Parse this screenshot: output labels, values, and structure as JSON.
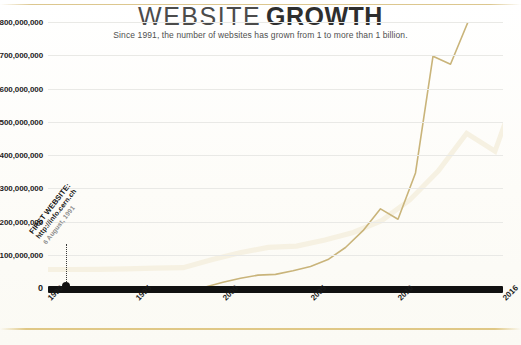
{
  "header": {
    "title_light": "WEBSITE",
    "title_bold": "GROWTH",
    "subtitle": "Since 1991, the number of websites has grown from 1 to more than 1 billion."
  },
  "annotation": {
    "line1": "FIRST WEBSITE:",
    "line2": "http://info.cern.ch",
    "line3": "6 August, 1991",
    "marker_year": 1991
  },
  "colors": {
    "line": "#c9b47a",
    "line_dark": "#b9a162",
    "axis": "#111111",
    "grid": "#e9e9e6",
    "frame_rule": "#ddc580",
    "title": "#3a3a3a",
    "background": "#fdfdfb",
    "watermark": "#f6f1e2"
  },
  "chart_data": {
    "type": "line",
    "title": "WEBSITE GROWTH",
    "subtitle": "Since 1991, the number of websites has grown from 1 to more than 1 billion.",
    "xlabel": "",
    "ylabel": "",
    "xlim": [
      1990,
      2016
    ],
    "ylim": [
      0,
      800000000
    ],
    "grid": true,
    "legend": false,
    "x_ticks": [
      1990,
      1995,
      2000,
      2005,
      2010,
      2016
    ],
    "x_tick_labels": [
      "1990",
      "1995",
      "2000",
      "2005",
      "2010",
      "2016"
    ],
    "y_ticks": [
      0,
      100000000,
      200000000,
      300000000,
      400000000,
      500000000,
      600000000,
      700000000,
      800000000
    ],
    "y_tick_labels": [
      "0",
      "100,000,000",
      "200,000,000",
      "300,000,000",
      "400,000,000",
      "500,000,000",
      "600,000,000",
      "700,000,000",
      "800,000,000"
    ],
    "y_top_label_clipped": true,
    "series": [
      {
        "name": "Number of websites",
        "color": "#c9b47a",
        "x": [
          1990,
          1991,
          1992,
          1993,
          1994,
          1995,
          1996,
          1997,
          1998,
          1999,
          2000,
          2001,
          2002,
          2003,
          2004,
          2005,
          2006,
          2007,
          2008,
          2009,
          2010,
          2011,
          2012,
          2013,
          2014,
          2015,
          2016
        ],
        "values": [
          0,
          1,
          10,
          130,
          2738,
          23500,
          257601,
          1117255,
          2410067,
          3177453,
          17087182,
          29254370,
          38760373,
          40912332,
          51611646,
          64780617,
          85507314,
          121892559,
          172338726,
          238027855,
          206956723,
          346004403,
          697089489,
          672985183,
          968882453,
          863105652,
          1000000000
        ]
      }
    ],
    "annotations": [
      {
        "text": "FIRST WEBSITE: http://info.cern.ch 6 August, 1991",
        "x": 1991,
        "y": 0
      }
    ]
  }
}
